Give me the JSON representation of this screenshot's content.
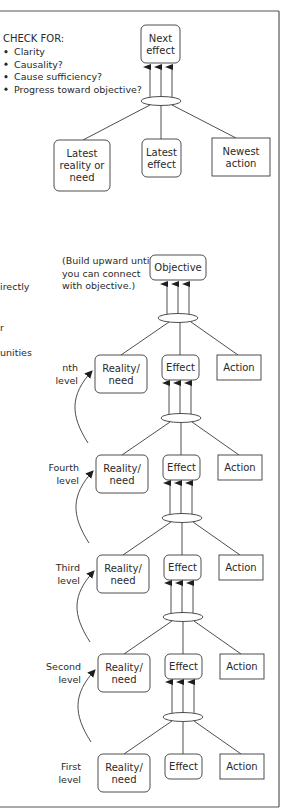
{
  "checklist": {
    "heading": "CHECK FOR:",
    "items": [
      "Clarity",
      "Causality?",
      "Cause sufficiency?",
      "Progress toward objective?"
    ]
  },
  "top_example": {
    "result": "Next effect",
    "result_lines": [
      "Next",
      "effect"
    ],
    "causes": [
      {
        "lines": [
          "Latest",
          "reality or",
          "need"
        ],
        "shape": "rounded"
      },
      {
        "lines": [
          "Latest",
          "effect"
        ],
        "shape": "rounded"
      },
      {
        "lines": [
          "Newest",
          "action"
        ],
        "shape": "square"
      }
    ]
  },
  "left_fragments": [
    "irectly",
    "r",
    "unities"
  ],
  "build_note": [
    "(Build upward until",
    "you can connect",
    "with objective.)"
  ],
  "objective": "Objective",
  "levels": [
    {
      "label": [
        "nth",
        "level"
      ],
      "reality": [
        "Reality/",
        "need"
      ],
      "effect": "Effect",
      "action": "Action"
    },
    {
      "label": [
        "Fourth",
        "level"
      ],
      "reality": [
        "Reality/",
        "need"
      ],
      "effect": "Effect",
      "action": "Action"
    },
    {
      "label": [
        "Third",
        "level"
      ],
      "reality": [
        "Reality/",
        "need"
      ],
      "effect": "Effect",
      "action": "Action"
    },
    {
      "label": [
        "Second",
        "level"
      ],
      "reality": [
        "Reality/",
        "need"
      ],
      "effect": "Effect",
      "action": "Action"
    },
    {
      "label": [
        "First",
        "level"
      ],
      "reality": [
        "Reality/",
        "need"
      ],
      "effect": "Effect",
      "action": "Action"
    }
  ]
}
